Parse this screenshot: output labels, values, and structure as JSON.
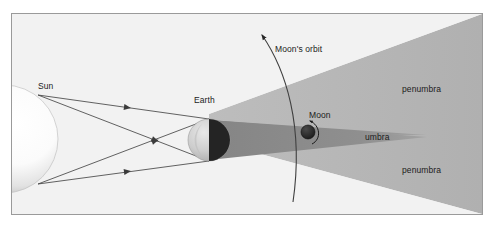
{
  "figure": {
    "frame": {
      "border_color": "#9a9a9a",
      "background_color": "#f2f2f2"
    }
  },
  "labels": {
    "sun": "Sun",
    "earth": "Earth",
    "moon": "Moon",
    "moons_orbit": "Moon's orbit",
    "umbra": "umbra",
    "penumbra_top": "penumbra",
    "penumbra_bottom": "penumbra"
  },
  "colors": {
    "background": "#f2f2f2",
    "border": "#9a9a9a",
    "penumbra": "#b4b4b4",
    "umbra": "#8e8e8e",
    "sunlight_region": "#ffffff",
    "ray_line": "#3b3b3b",
    "earth_lit": "#cfcfcf",
    "earth_dark": "#2b2b2b",
    "moon": "#262626",
    "orbit_line": "#4a4a4a",
    "text": "#1b1b1b"
  },
  "bodies": {
    "sun": {
      "name": "Sun",
      "cx": 2,
      "cy": 125,
      "r": 44
    },
    "earth": {
      "name": "Earth",
      "cx": 208,
      "cy": 126,
      "r": 22
    },
    "moon": {
      "name": "Moon",
      "cx": 307,
      "cy": 118,
      "r": 7
    }
  },
  "shadows": {
    "umbra": {
      "name": "umbra",
      "apex_x": 425,
      "apex_y": 122
    },
    "penumbra": {
      "name": "penumbra",
      "spread": "widening toward right edge"
    }
  },
  "rays": {
    "count": 4,
    "description": "sunlight rays crossing in an X between Sun and Earth",
    "arrowheads": 4
  },
  "orbit": {
    "name": "Moon's orbit",
    "direction": "counter-clockwise, arrow pointing up-left"
  }
}
